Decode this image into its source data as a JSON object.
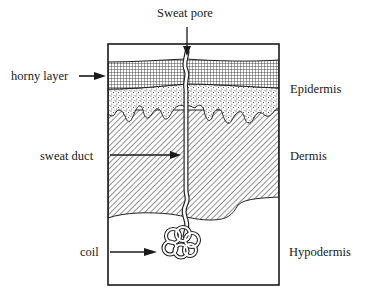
{
  "diagram": {
    "labels": {
      "sweat_pore": "Sweat pore",
      "horny_layer": "horny layer",
      "sweat_duct": "sweat duct",
      "coil": "coil",
      "epidermis": "Epidermis",
      "dermis": "Dermis",
      "hypodermis": "Hypodermis"
    },
    "colors": {
      "ink": "#1a1a1a",
      "background": "#ffffff"
    }
  }
}
